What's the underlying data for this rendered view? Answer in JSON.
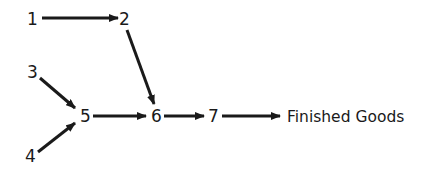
{
  "diagram": {
    "type": "flow",
    "nodes": [
      {
        "id": "1",
        "label": "1",
        "x": 32,
        "y": 19
      },
      {
        "id": "2",
        "label": "2",
        "x": 124,
        "y": 19
      },
      {
        "id": "3",
        "label": "3",
        "x": 32,
        "y": 72
      },
      {
        "id": "4",
        "label": "4",
        "x": 31,
        "y": 155
      },
      {
        "id": "5",
        "label": "5",
        "x": 85,
        "y": 116
      },
      {
        "id": "6",
        "label": "6",
        "x": 156,
        "y": 116
      },
      {
        "id": "7",
        "label": "7",
        "x": 213,
        "y": 116
      },
      {
        "id": "fg",
        "label": "Finished Goods",
        "x": 287,
        "y": 116
      }
    ],
    "edges": [
      {
        "from": "1",
        "to": "2"
      },
      {
        "from": "2",
        "to": "6"
      },
      {
        "from": "3",
        "to": "5"
      },
      {
        "from": "4",
        "to": "5"
      },
      {
        "from": "5",
        "to": "6"
      },
      {
        "from": "6",
        "to": "7"
      },
      {
        "from": "7",
        "to": "fg"
      }
    ],
    "color": "#1a1a1a"
  }
}
